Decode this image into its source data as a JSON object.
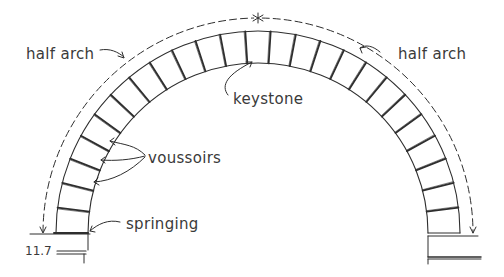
{
  "figure": {
    "number": "11.7",
    "type": "hand-drawn architectural diagram of a semicircular masonry arch"
  },
  "labels": {
    "half_arch_left": "half arch",
    "half_arch_right": "half arch",
    "keystone": "keystone",
    "voussoirs": "voussoirs",
    "springing": "springing"
  },
  "geometry": {
    "center_x": 258,
    "springing_y": 233,
    "intrados_radius": 170,
    "extrados_radius": 202,
    "dimension_radius": 215,
    "stone_count": 25,
    "ink_color": "#2e2e2e",
    "background": "#ffffff"
  }
}
